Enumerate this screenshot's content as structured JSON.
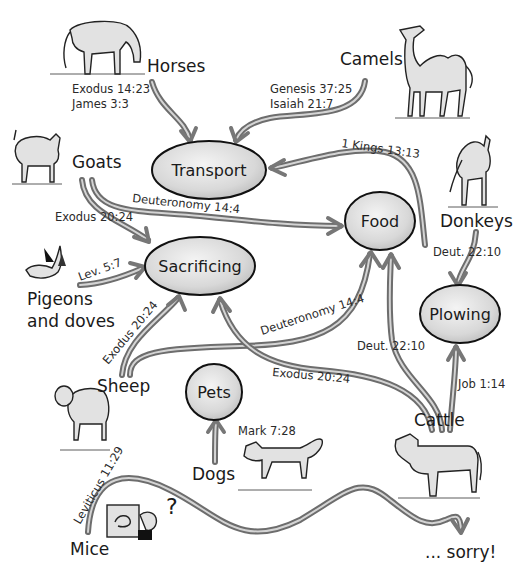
{
  "diagram": {
    "hubs": {
      "transport": "Transport",
      "food": "Food",
      "sacrificing": "Sacrificing",
      "plowing": "Plowing",
      "pets": "Pets"
    },
    "animals": {
      "horses": "Horses",
      "camels": "Camels",
      "goats": "Goats",
      "donkeys": "Donkeys",
      "pigeons_line1": "Pigeons",
      "pigeons_line2": "and doves",
      "sheep": "Sheep",
      "cattle": "Cattle",
      "dogs": "Dogs",
      "mice": "Mice"
    },
    "references": {
      "horses_transport_1": "Exodus 14:23",
      "horses_transport_2": "James 3:3",
      "camels_transport_1": "Genesis 37:25",
      "camels_transport_2": "Isaiah 21:7",
      "donkeys_transport": "1 Kings 13:13",
      "goats_food": "Deuteronomy 14:4",
      "goats_sacrificing": "Exodus 20:24",
      "pigeons_sacrificing": "Lev. 5:7",
      "sheep_sacrificing": "Exodus 20:24",
      "sheep_food": "Deuteronomy 14:4",
      "donkeys_plowing": "Deut. 22:10",
      "cattle_food": "Deut. 22:10",
      "cattle_sacrificing": "Exodus 20:24",
      "cattle_plowing": "Job 1:14",
      "dogs_pets": "Mark 7:28",
      "mice_none": "Leviticus 11:29"
    },
    "ending": "... sorry!",
    "question_mark": "?",
    "colors": {
      "hub_fill": "#d9d9d9",
      "hub_stroke": "#111111",
      "arrow": "#6d6d6d",
      "text": "#1a1a1a",
      "background": "#ffffff"
    }
  }
}
